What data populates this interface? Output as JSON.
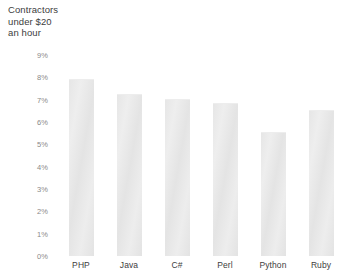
{
  "chart_data": {
    "type": "bar",
    "title": "Contractors\nunder $20\nan hour",
    "xlabel": "",
    "ylabel": "",
    "categories": [
      "PHP",
      "Java",
      "C#",
      "Perl",
      "Python",
      "Ruby"
    ],
    "values": [
      7.9,
      7.2,
      7.0,
      6.8,
      5.5,
      6.5
    ],
    "value_labels": [
      "7.9%",
      "7.2%",
      "7.0%",
      "6.8%",
      "5.5%",
      "6.5%"
    ],
    "ylim": [
      0,
      9
    ],
    "ytick_labels": [
      "9%",
      "8%",
      "7%",
      "6%",
      "5%",
      "4%",
      "3%",
      "2%",
      "1%",
      "0%"
    ],
    "ytick_values": [
      9,
      8,
      7,
      6,
      5,
      4,
      3,
      2,
      1,
      0
    ],
    "grid": false,
    "legend": null,
    "units": "percent",
    "bar_color": "#e8e8e8"
  },
  "colors": {
    "background": "#ffffff",
    "bar_fill": "#e8e8e8",
    "title_text": "#3d3d3d",
    "tick_text": "#8a8a8a",
    "category_text": "#3d3d3d"
  }
}
